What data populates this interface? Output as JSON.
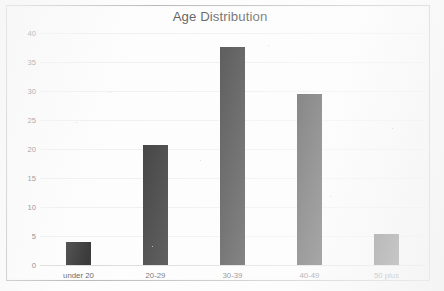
{
  "chart_data": {
    "type": "bar",
    "title": "Age Distribution",
    "xlabel": "",
    "ylabel": "",
    "categories": [
      "under 20",
      "20-29",
      "30-39",
      "40-49",
      "50 plus"
    ],
    "values": [
      3.9,
      20.7,
      37.6,
      29.5,
      5.3
    ],
    "ylim": [
      0,
      40
    ],
    "yticks": [
      0,
      5,
      10,
      15,
      20,
      25,
      30,
      35,
      40
    ],
    "ytick_labels": [
      "0",
      "5",
      "10",
      "15",
      "20",
      "25",
      "30",
      "35",
      "40"
    ],
    "grid": true,
    "legend": false,
    "bar_color": "#0a0a0a",
    "grid_color": "#ececec",
    "axis_color": "#d2d2d2",
    "title_color": "#2d2d2d",
    "label_color": "#3a3a3a",
    "frame_color": "#a9a9a9",
    "background_color": "#fdfdfd"
  }
}
